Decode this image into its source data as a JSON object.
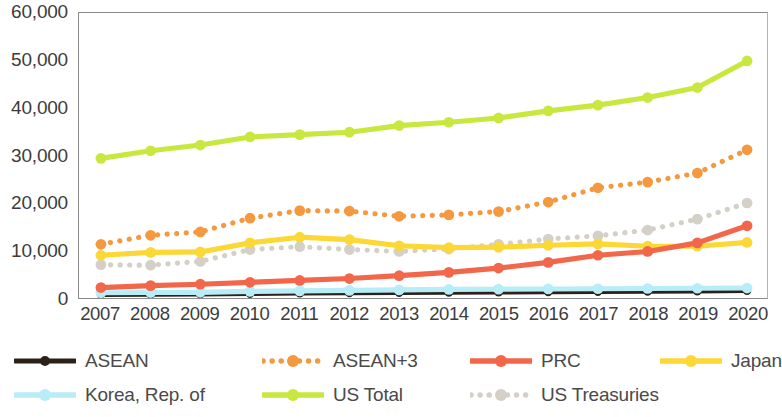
{
  "chart_data": {
    "type": "line",
    "title": "",
    "subtitle": "",
    "xlabel": "",
    "ylabel": "",
    "categories": [
      "2007",
      "2008",
      "2009",
      "2010",
      "2011",
      "2012",
      "2013",
      "2014",
      "2015",
      "2016",
      "2017",
      "2018",
      "2019",
      "2020"
    ],
    "x_tick_labels": [
      "2007",
      "2008",
      "2009",
      "2010",
      "2011",
      "2012",
      "2013",
      "2014",
      "2015",
      "2016",
      "2017",
      "2018",
      "2019",
      "2020"
    ],
    "y_tick_labels": [
      "0",
      "10,000",
      "20,000",
      "30,000",
      "40,000",
      "50,000",
      "60,000"
    ],
    "y_tick_values": [
      0,
      10000,
      20000,
      30000,
      40000,
      50000,
      60000
    ],
    "ylim": [
      0,
      60000
    ],
    "grid": false,
    "legend_position": "bottom",
    "series": [
      {
        "name": "ASEAN",
        "color": "#2b2119",
        "style": "solid",
        "marker": "circle",
        "values": [
          700,
          750,
          800,
          900,
          1000,
          1050,
          1100,
          1150,
          1200,
          1250,
          1300,
          1350,
          1400,
          1500
        ]
      },
      {
        "name": "ASEAN+3",
        "color": "#f4993f",
        "style": "dotted",
        "marker": "circle",
        "values": [
          11300,
          13200,
          13900,
          16800,
          18400,
          18300,
          17200,
          17500,
          18200,
          20200,
          23200,
          24400,
          26300,
          31200
        ]
      },
      {
        "name": "PRC",
        "color": "#f2674a",
        "style": "solid",
        "marker": "circle",
        "values": [
          2200,
          2600,
          2900,
          3300,
          3700,
          4100,
          4700,
          5400,
          6300,
          7500,
          9000,
          9800,
          11600,
          15200
        ]
      },
      {
        "name": "Japan",
        "color": "#fbd836",
        "style": "solid",
        "marker": "circle",
        "values": [
          9000,
          9600,
          9700,
          11600,
          12800,
          12300,
          11000,
          10600,
          10700,
          11100,
          11400,
          10900,
          10900,
          11700
        ]
      },
      {
        "name": "Korea, Rep. of",
        "color": "#b8ecf7",
        "style": "solid",
        "marker": "circle",
        "values": [
          1100,
          1150,
          1200,
          1400,
          1500,
          1600,
          1700,
          1800,
          1850,
          1900,
          1950,
          2000,
          2050,
          2100
        ]
      },
      {
        "name": "US Total",
        "color": "#c8e840",
        "style": "solid",
        "marker": "circle",
        "values": [
          29400,
          31000,
          32200,
          33900,
          34400,
          34900,
          36300,
          37000,
          37900,
          39400,
          40600,
          42200,
          44300,
          49900
        ]
      },
      {
        "name": "US Treasuries",
        "color": "#d4d0c8",
        "style": "dotted",
        "marker": "circle",
        "values": [
          7000,
          6900,
          7700,
          10200,
          10800,
          10200,
          9800,
          10300,
          11300,
          12400,
          13100,
          14300,
          16600,
          20000
        ]
      }
    ]
  },
  "legend": {
    "items": [
      {
        "label": "ASEAN",
        "color": "#2b2119",
        "style": "solid",
        "marker": "circle"
      },
      {
        "label": "ASEAN+3",
        "color": "#f4993f",
        "style": "dotted",
        "marker": "circle"
      },
      {
        "label": "PRC",
        "color": "#f2674a",
        "style": "solid",
        "marker": "circle"
      },
      {
        "label": "Japan",
        "color": "#fbd836",
        "style": "solid",
        "marker": "circle"
      },
      {
        "label": "Korea, Rep. of",
        "color": "#b8ecf7",
        "style": "solid",
        "marker": "circle"
      },
      {
        "label": "US Total",
        "color": "#c8e840",
        "style": "solid",
        "marker": "circle"
      },
      {
        "label": "US Treasuries",
        "color": "#d4d0c8",
        "style": "dotted",
        "marker": "circle"
      }
    ],
    "row1": [
      "ASEAN",
      "ASEAN+3",
      "PRC",
      "Japan"
    ],
    "row2": [
      "Korea, Rep. of",
      "US Total",
      "US Treasuries"
    ]
  }
}
